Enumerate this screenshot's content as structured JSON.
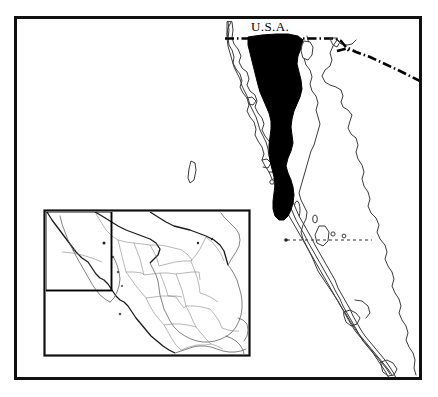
{
  "figure": {
    "type": "distribution-map",
    "title": "",
    "region": "Baja California Peninsula, Mexico and adjacent U.S.A.",
    "background_color": "#ffffff",
    "frame_color": "#111111",
    "width": 438,
    "height": 397
  },
  "labels": {
    "usa": "U.S.A."
  },
  "legend": {
    "shaded_area_meaning": "shaded distribution range",
    "shaded_color": "#000000",
    "coastline_color": "#3a3a3a",
    "border_color": "#000000"
  },
  "map_features": {
    "international_border": {
      "name": "U.S.A. - Mexico border",
      "style": "dash-dot",
      "color": "#000000"
    },
    "state_border": {
      "name": "Baja California / Baja California Sur boundary",
      "style": "dotted",
      "color": "#333333"
    },
    "shaded_range": {
      "name": "northern Baja California shaded range",
      "color": "#000000"
    },
    "island": {
      "name": "Isla Guadalupe",
      "color": "#ffffff"
    }
  },
  "inset": {
    "name": "locator-inset",
    "region": "Mexico",
    "frame_color": "#111111",
    "highlight_box": {
      "name": "detail-area-highlight",
      "color": "#000000"
    }
  }
}
